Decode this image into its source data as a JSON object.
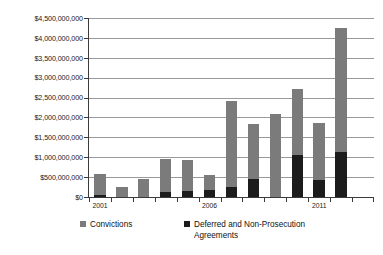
{
  "chart_data": {
    "type": "bar",
    "subtype": "stacked-vertical",
    "title": "",
    "subtitle": "",
    "xlabel": "",
    "ylabel": "",
    "ylim": [
      0,
      4500000000
    ],
    "ytick_step": 500000000,
    "ytick_labels": [
      "$0",
      "$500,000,000",
      "$1,000,000,000",
      "$1,500,000,000",
      "$2,000,000,000",
      "$2,500,000,000",
      "$3,000,000,000",
      "$3,500,000,000",
      "$4,000,000,000",
      "$4,500,000,000"
    ],
    "ytick_values": [
      0,
      500000000,
      1000000000,
      1500000000,
      2000000000,
      2500000000,
      3000000000,
      3500000000,
      4000000000,
      4500000000
    ],
    "grid": true,
    "grid_axis": "y",
    "legend_position": "bottom",
    "categories": [
      "2001",
      "2002",
      "2003",
      "2004",
      "2005",
      "2006",
      "2007",
      "2008",
      "2009",
      "2010",
      "2011",
      "2012",
      "2013"
    ],
    "xtick_labels_shown": [
      "2001",
      "2006",
      "2011"
    ],
    "xtick_label_indices": [
      0,
      5,
      10
    ],
    "series": [
      {
        "name": "Deferred and Non-Prosecution Agreements",
        "color": "#1c1c1c",
        "values": [
          50000000,
          0,
          0,
          130000000,
          150000000,
          180000000,
          240000000,
          460000000,
          0,
          1060000000,
          440000000,
          1130000000,
          0
        ]
      },
      {
        "name": "Convictions",
        "color": "#7b7b7b",
        "values": [
          520000000,
          240000000,
          450000000,
          820000000,
          770000000,
          380000000,
          2170000000,
          1380000000,
          2090000000,
          1660000000,
          1420000000,
          3120000000,
          0
        ]
      }
    ],
    "totals": [
      570000000,
      240000000,
      450000000,
      950000000,
      920000000,
      560000000,
      2410000000,
      1840000000,
      2090000000,
      2720000000,
      1860000000,
      4250000000,
      0
    ],
    "annotations": []
  },
  "legend": {
    "items": [
      {
        "label": "Convictions",
        "color": "#7b7b7b"
      },
      {
        "label": "Deferred and Non-Prosecution\nAgreements",
        "color": "#1c1c1c"
      }
    ]
  },
  "colors": {
    "convictions": "#7b7b7b",
    "agreements": "#1c1c1c",
    "gridline": "#9a9a9a",
    "axis": "#3a3a3a",
    "background": "#ffffff",
    "text": "#1a1a1a"
  }
}
